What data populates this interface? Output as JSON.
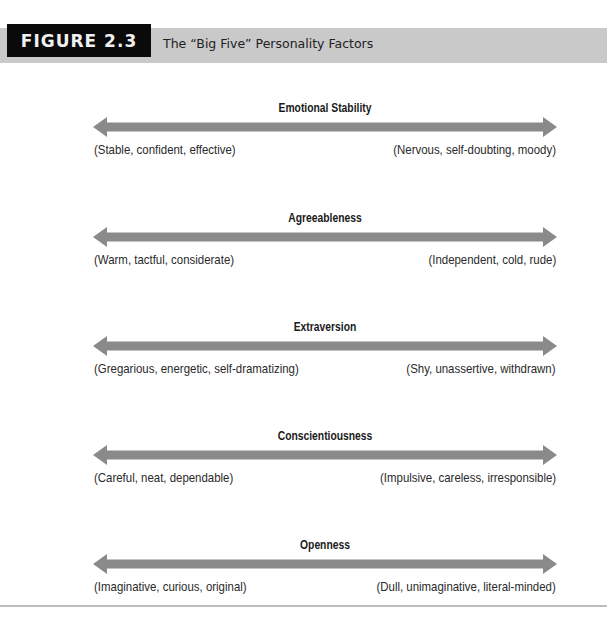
{
  "header": {
    "figure_label": "FIGURE 2.3",
    "subtitle": "The “Big Five” Personality Factors"
  },
  "colors": {
    "figure_box_bg": "#0a0a0a",
    "header_bar_bg": "#c9c9c9",
    "arrow": "#8a8a8a",
    "rule": "#bcbcbc"
  },
  "factors": [
    {
      "name": "Emotional Stability",
      "left_pole": "(Stable, confident, effective)",
      "right_pole": "(Nervous, self-doubting, moody)"
    },
    {
      "name": "Agreeableness",
      "left_pole": "(Warm, tactful, considerate)",
      "right_pole": "(Independent, cold, rude)"
    },
    {
      "name": "Extraversion",
      "left_pole": "(Gregarious, energetic, self-dramatizing)",
      "right_pole": "(Shy, unassertive, withdrawn)"
    },
    {
      "name": "Conscientiousness",
      "left_pole": "(Careful, neat, dependable)",
      "right_pole": "(Impulsive, careless, irresponsible)"
    },
    {
      "name": "Openness",
      "left_pole": "(Imaginative, curious, original)",
      "right_pole": "(Dull, unimaginative, literal-minded)"
    }
  ]
}
